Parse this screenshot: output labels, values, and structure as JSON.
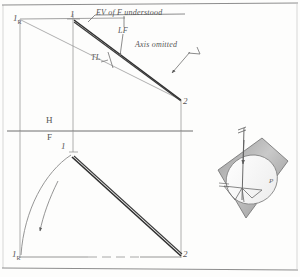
{
  "figure": {
    "background_color": "#fdfdfc",
    "ink_color": "#6b6b6b",
    "heavy_ink_color": "#2e2e2e"
  },
  "border": {
    "top_rule": "horizontal rule near top of sheet",
    "bottom_rule": "horizontal rule near bottom of sheet"
  },
  "notes": [
    {
      "id": "ev-note",
      "text": "EV of F understood"
    },
    {
      "id": "lf-note",
      "text": "LF"
    },
    {
      "id": "tl-note",
      "text": "TL"
    },
    {
      "id": "axis-note",
      "text": "Axis omitted"
    }
  ],
  "fold_line": {
    "upper_label": "H",
    "lower_label": "F"
  },
  "top_view": {
    "name": "horizontal (top) view",
    "points": [
      {
        "label": "1",
        "subscript": "R",
        "x": 18,
        "y": 20
      },
      {
        "label": "1",
        "subscript": "",
        "x": 73,
        "y": 18
      },
      {
        "label": "2",
        "subscript": "",
        "x": 182,
        "y": 101
      }
    ]
  },
  "front_view": {
    "name": "frontal (front) view",
    "points": [
      {
        "label": "1",
        "subscript": "",
        "x": 64,
        "y": 150
      },
      {
        "label": "1",
        "subscript": "R",
        "x": 18,
        "y": 256
      },
      {
        "label": "2",
        "subscript": "",
        "x": 182,
        "y": 256
      }
    ],
    "arc_label": "rotation arc",
    "arrow_label": "direction of revolution"
  },
  "pictorial": {
    "name": "pictorial of revolution",
    "axis_label": "axis",
    "plane_label": "P",
    "description": "inclined plane containing circular path of revolution with vertical axis"
  }
}
